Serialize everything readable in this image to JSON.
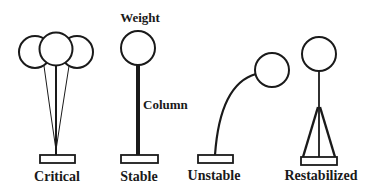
{
  "diagram": {
    "type": "column-stability-illustration",
    "figures": [
      {
        "id": "critical",
        "label": "Critical"
      },
      {
        "id": "stable",
        "label": "Stable"
      },
      {
        "id": "unstable",
        "label": "Unstable"
      },
      {
        "id": "restabilized",
        "label": "Restabilized"
      }
    ],
    "annotations": {
      "weight": "Weight",
      "column": "Column"
    },
    "colors": {
      "stroke": "#1a1a1a",
      "background": "#ffffff"
    }
  }
}
